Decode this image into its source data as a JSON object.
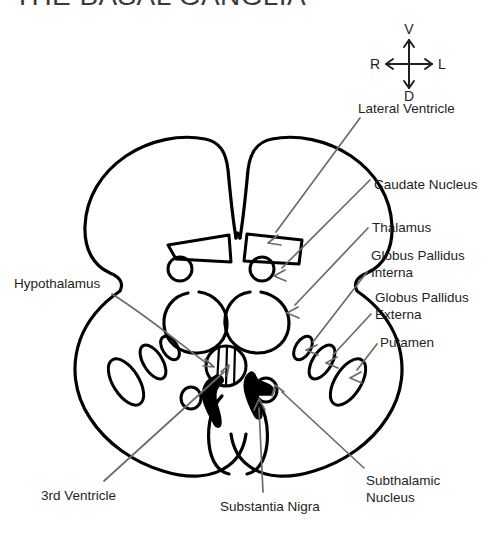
{
  "title": "THE BASAL GANGLIA",
  "compass": {
    "name": "orientation-compass",
    "up": "V",
    "down": "D",
    "left": "R",
    "right": "L"
  },
  "colors": {
    "background": "#ffffff",
    "outline": "#000000",
    "leader_line": "#6b6b6b",
    "text": "#231f20",
    "title": "#3a3a3a",
    "filled_structure": "#000000"
  },
  "labels": [
    {
      "id": "lateral-ventricle",
      "text": "Lateral Ventricle",
      "x": 358,
      "y": 100,
      "align": "left"
    },
    {
      "id": "caudate-nucleus",
      "text": "Caudate Nucleus",
      "x": 374,
      "y": 176,
      "align": "left"
    },
    {
      "id": "thalamus",
      "text": "Thalamus",
      "x": 372,
      "y": 219,
      "align": "left"
    },
    {
      "id": "globus-pallidus-interna",
      "text": "Globus Pallidus\nInterna",
      "x": 371,
      "y": 247,
      "align": "left"
    },
    {
      "id": "globus-pallidus-externa",
      "text": "Globus Pallidus\nExterna",
      "x": 375,
      "y": 289,
      "align": "left"
    },
    {
      "id": "putamen",
      "text": "Putamen",
      "x": 380,
      "y": 334,
      "align": "left"
    },
    {
      "id": "hypothalamus",
      "text": "Hypothalamus",
      "x": 14,
      "y": 275,
      "align": "left"
    },
    {
      "id": "third-ventricle",
      "text": "3rd Ventricle",
      "x": 41,
      "y": 487,
      "align": "left"
    },
    {
      "id": "substantia-nigra",
      "text": "Substantia Nigra",
      "x": 220,
      "y": 498,
      "align": "left"
    },
    {
      "id": "subthalamic-nucleus",
      "text": "Subthalamic\nNucleus",
      "x": 366,
      "y": 472,
      "align": "left"
    }
  ],
  "structures": [
    {
      "id": "cortex-outline",
      "name": "brain-cross-section-outline",
      "count": 1
    },
    {
      "id": "lateral-ventricles",
      "name": "lateral-ventricle-shape",
      "count": 2
    },
    {
      "id": "caudate-nuclei",
      "name": "caudate-nucleus-shape",
      "count": 2
    },
    {
      "id": "thalami",
      "name": "thalamus-shape",
      "count": 2
    },
    {
      "id": "third-ventricle-shape",
      "name": "third-ventricle-shape",
      "count": 1
    },
    {
      "id": "putamen-shapes",
      "name": "putamen-shape",
      "count": 2
    },
    {
      "id": "gpe-shapes",
      "name": "globus-pallidus-externa-shape",
      "count": 2
    },
    {
      "id": "gpi-shapes",
      "name": "globus-pallidus-interna-shape",
      "count": 2
    },
    {
      "id": "substantia-nigra-shapes",
      "name": "substantia-nigra-shape",
      "count": 2
    },
    {
      "id": "subthalamic-shapes",
      "name": "subthalamic-nucleus-shape",
      "count": 2
    }
  ]
}
